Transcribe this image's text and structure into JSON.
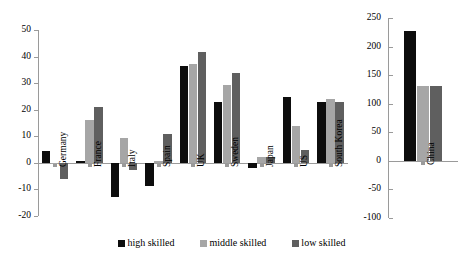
{
  "chart_data": {
    "type": "bar",
    "title": "",
    "xlabel": "",
    "ylabel": "",
    "grid": false,
    "legend_position": "bottom",
    "panels": [
      {
        "name": "main-panel",
        "ylim": [
          -20,
          50
        ],
        "yticks": [
          50,
          40,
          30,
          20,
          10,
          0,
          -10,
          -20
        ],
        "categories": [
          "Germany",
          "France",
          "Italy",
          "Spain",
          "UK",
          "Sweden",
          "Japan",
          "US",
          "South Korea"
        ],
        "series": [
          {
            "name": "high skilled",
            "color": "#0d0d0d",
            "values": [
              4.5,
              0.8,
              -13.0,
              -8.7,
              36.5,
              23.0,
              -1.8,
              24.7,
              22.8
            ]
          },
          {
            "name": "middle skilled",
            "color": "#a6a6a6",
            "values": [
              -0.4,
              16.2,
              9.4,
              0.8,
              37.3,
              29.2,
              2.2,
              13.7,
              24.2
            ]
          },
          {
            "name": "low skilled",
            "color": "#5f5f5f",
            "values": [
              -6.0,
              21.0,
              -2.6,
              10.7,
              41.8,
              34.0,
              2.1,
              4.9,
              23.0
            ]
          }
        ]
      },
      {
        "name": "china-panel",
        "ylim": [
          -100,
          250
        ],
        "yticks": [
          250,
          200,
          150,
          100,
          50,
          0,
          -50,
          -100
        ],
        "categories": [
          "China"
        ],
        "series": [
          {
            "name": "high skilled",
            "color": "#0d0d0d",
            "values": [
              228
            ]
          },
          {
            "name": "middle skilled",
            "color": "#a6a6a6",
            "values": [
              131
            ]
          },
          {
            "name": "low skilled",
            "color": "#5f5f5f",
            "values": [
              131
            ]
          }
        ]
      }
    ],
    "legend": [
      {
        "label": "high skilled",
        "color": "#0d0d0d"
      },
      {
        "label": "middle skilled",
        "color": "#a6a6a6"
      },
      {
        "label": "low skilled",
        "color": "#5f5f5f"
      }
    ]
  }
}
